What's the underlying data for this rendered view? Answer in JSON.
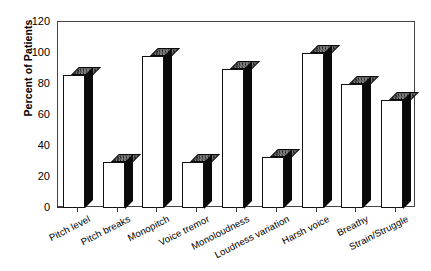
{
  "chart_data": {
    "type": "bar",
    "title": "",
    "xlabel": "",
    "ylabel": "Percent of Patients",
    "ylim": [
      0,
      120
    ],
    "ytick_step": 20,
    "yminor_step": 10,
    "grid": false,
    "legend": null,
    "style": "3d-shaded-bars",
    "categories": [
      "Pitch level",
      "Pitch breaks",
      "Monopitch",
      "Voice tremor",
      "Monoloudness",
      "Loudness variation",
      "Harsh voice",
      "Breathy",
      "Strain/Struggle"
    ],
    "values": [
      86,
      30,
      98,
      30,
      90,
      33,
      100,
      80,
      70
    ],
    "ytick_labels": [
      "0",
      "20",
      "40",
      "60",
      "80",
      "100",
      "120"
    ],
    "ytick_values": [
      0,
      20,
      40,
      60,
      80,
      100,
      120
    ],
    "yminor_values": [
      10,
      30,
      50,
      70,
      90,
      110
    ]
  },
  "axis": {
    "ylabel": "Percent of Patients"
  }
}
